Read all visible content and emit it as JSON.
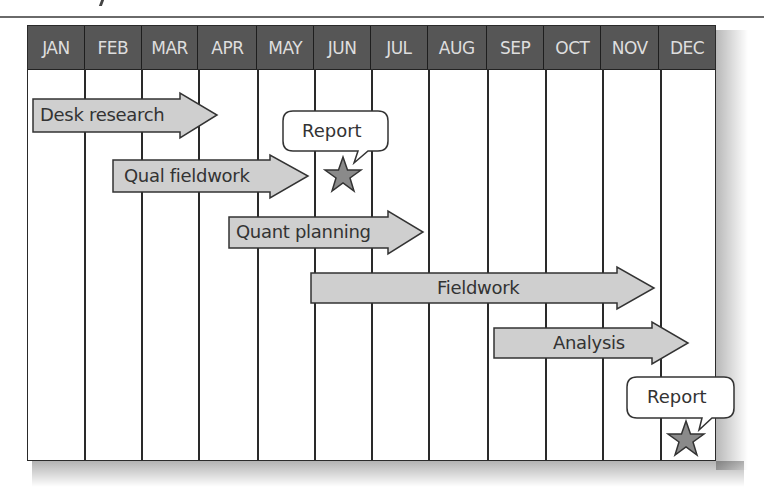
{
  "diagram": {
    "type": "gantt-timeline",
    "months": [
      "JAN",
      "FEB",
      "MAR",
      "APR",
      "MAY",
      "JUN",
      "JUL",
      "AUG",
      "SEP",
      "OCT",
      "NOV",
      "DEC"
    ],
    "tasks": [
      {
        "label": "Desk research",
        "start": "JAN",
        "end": "APR"
      },
      {
        "label": "Qual fieldwork",
        "start": "FEB",
        "end": "MAY"
      },
      {
        "label": "Quant planning",
        "start": "APR",
        "end": "JUL"
      },
      {
        "label": "Fieldwork",
        "start": "JUN",
        "end": "NOV"
      },
      {
        "label": "Analysis",
        "start": "SEP",
        "end": "DEC"
      }
    ],
    "milestones": [
      {
        "label": "Report",
        "month": "JUN",
        "icon": "star-icon"
      },
      {
        "label": "Report",
        "month": "DEC",
        "icon": "star-icon"
      }
    ],
    "colors": {
      "header_bg": "#565656",
      "header_text": "#dedede",
      "arrow_fill": "#cfcfcf",
      "arrow_stroke": "#333333",
      "star_fill": "#8a8a8a",
      "grid_line": "#2a2a2a"
    }
  }
}
